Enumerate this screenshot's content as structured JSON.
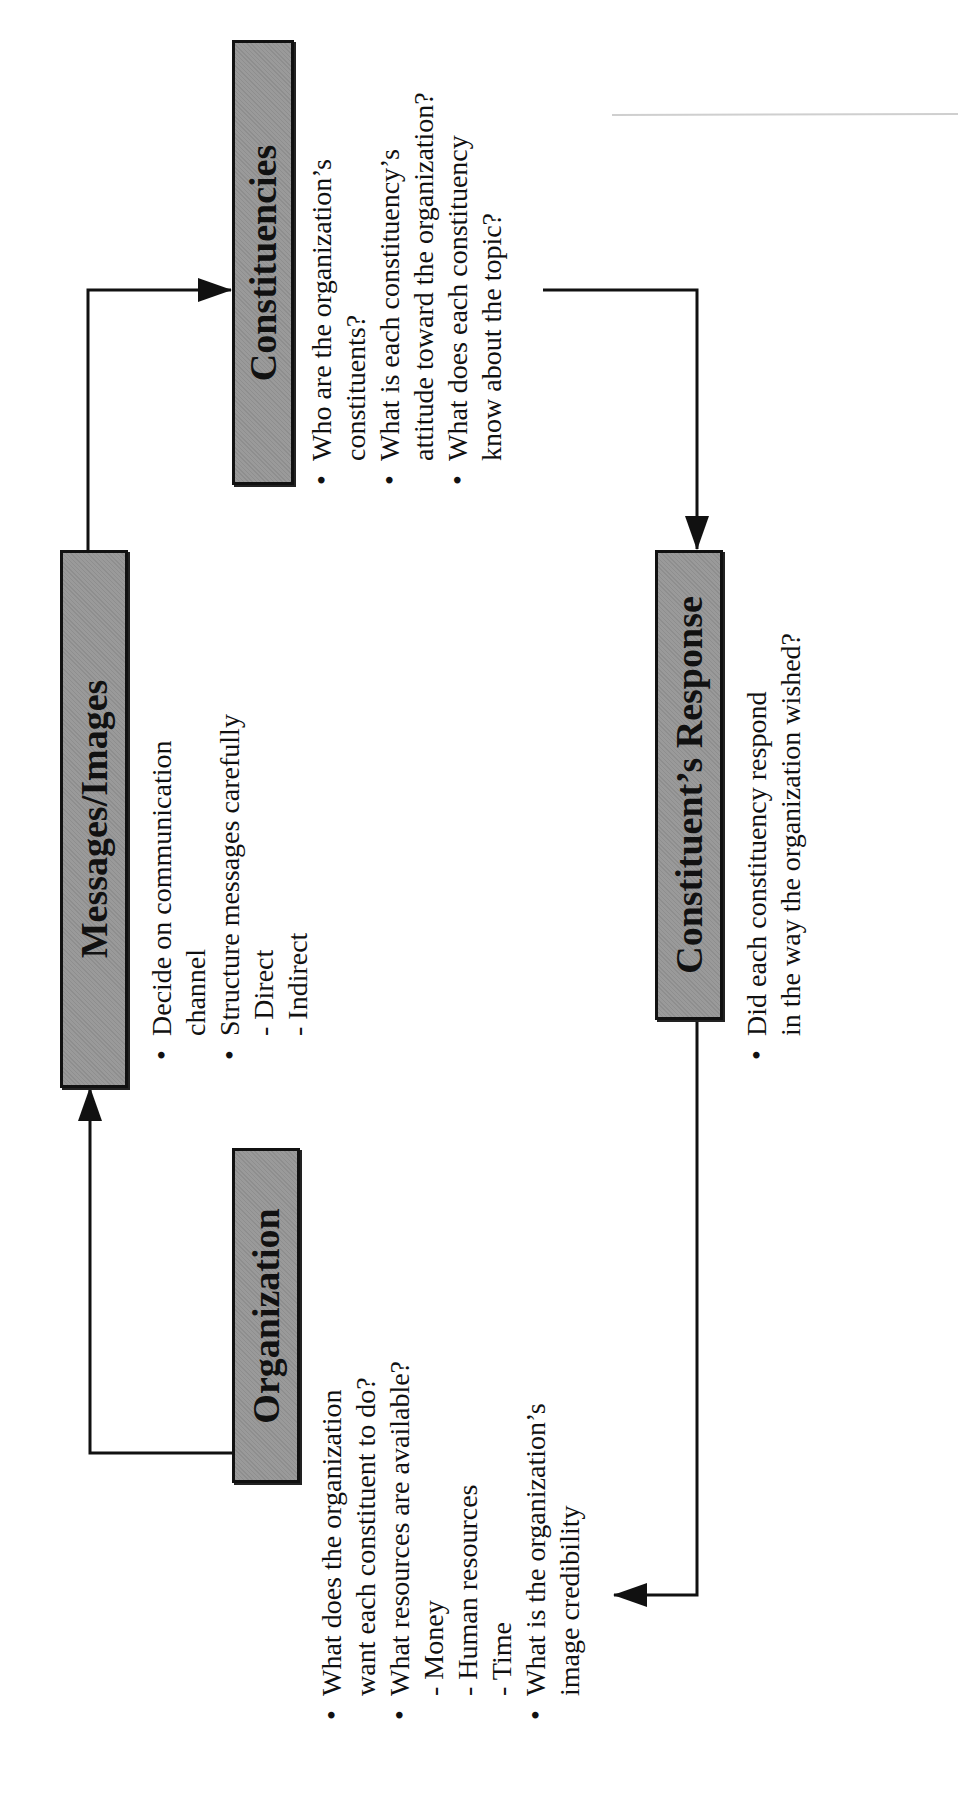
{
  "diagram": {
    "orientation": "rotated-90-ccw",
    "nodes": {
      "organization": {
        "title": "Organization",
        "lines": [
          {
            "type": "bullet",
            "text": "What does the organization"
          },
          {
            "type": "cont",
            "text": "want each constituent to do?"
          },
          {
            "type": "bullet",
            "text": "What resources are available?"
          },
          {
            "type": "sub",
            "text": "- Money"
          },
          {
            "type": "sub",
            "text": "- Human resources"
          },
          {
            "type": "sub",
            "text": "- Time"
          },
          {
            "type": "bullet",
            "text": "What is the organization’s"
          },
          {
            "type": "cont",
            "text": "image credibility"
          }
        ]
      },
      "messages": {
        "title": "Messages/Images",
        "lines": [
          {
            "type": "bullet",
            "text": "Decide on communication"
          },
          {
            "type": "cont",
            "text": "channel"
          },
          {
            "type": "bullet",
            "text": "Structure messages carefully"
          },
          {
            "type": "sub",
            "text": "- Direct"
          },
          {
            "type": "sub",
            "text": "- Indirect"
          }
        ]
      },
      "constituencies": {
        "title": "Constituencies",
        "lines": [
          {
            "type": "bullet",
            "text": "Who are the organization’s"
          },
          {
            "type": "cont",
            "text": "constituents?"
          },
          {
            "type": "bullet",
            "text": "What is each constituency’s"
          },
          {
            "type": "cont",
            "text": "attitude toward the organization?"
          },
          {
            "type": "bullet",
            "text": "What does each constituency"
          },
          {
            "type": "cont",
            "text": "know about the topic?"
          }
        ]
      },
      "response": {
        "title": "Constituent’s Response",
        "lines": [
          {
            "type": "bullet",
            "text": "Did each constituency respond"
          },
          {
            "type": "cont",
            "text": "in the way the organization wished?"
          }
        ]
      }
    },
    "edges": [
      {
        "from": "Organization",
        "to": "Messages/Images"
      },
      {
        "from": "Messages/Images",
        "to": "Constituencies"
      },
      {
        "from": "Constituencies",
        "to": "Constituent’s Response"
      },
      {
        "from": "Constituent’s Response",
        "to": "Organization"
      }
    ],
    "colors": {
      "box_fill": "#9a9a9a",
      "stroke": "#111111"
    }
  }
}
